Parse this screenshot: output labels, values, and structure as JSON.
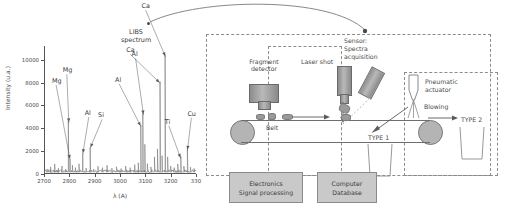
{
  "figure": {
    "callout": {
      "line1": "LIBS",
      "line2": "spectrum"
    }
  },
  "chart_data": {
    "type": "line",
    "title": "LIBS spectrum",
    "xlabel": "λ (A)",
    "ylabel": "Intensity (u.a.)",
    "xlim": [
      2700,
      3300
    ],
    "ylim": [
      0,
      11200
    ],
    "xticks": [
      "2700",
      "2800",
      "2900",
      "3000",
      "3100",
      "3200",
      "330"
    ],
    "xtick_values": [
      2700,
      2800,
      2900,
      3000,
      3100,
      3200,
      3300
    ],
    "yticks": [
      "0",
      "2000",
      "4000",
      "6000",
      "8000",
      "10000"
    ],
    "ytick_values": [
      0,
      2000,
      4000,
      6000,
      8000,
      10000
    ],
    "grid": false,
    "legend": false,
    "annotations": [
      {
        "label": "Mg",
        "x": 2798,
        "y": 4700
      },
      {
        "label": "Mg",
        "x": 2803,
        "y": 1500
      },
      {
        "label": "Al",
        "x": 2853,
        "y": 2000
      },
      {
        "label": "Si",
        "x": 2882,
        "y": 2500
      },
      {
        "label": "Al",
        "x": 3083,
        "y": 4400
      },
      {
        "label": "Al",
        "x": 3093,
        "y": 5400
      },
      {
        "label": "Ca",
        "x": 3159,
        "y": 8200
      },
      {
        "label": "Ca",
        "x": 3180,
        "y": 10500
      },
      {
        "label": "Ti",
        "x": 3240,
        "y": 1600
      },
      {
        "label": "Cu",
        "x": 3266,
        "y": 2300
      }
    ],
    "peaks": [
      {
        "x": 2712,
        "y": 430
      },
      {
        "x": 2726,
        "y": 620
      },
      {
        "x": 2742,
        "y": 880
      },
      {
        "x": 2757,
        "y": 500
      },
      {
        "x": 2771,
        "y": 700
      },
      {
        "x": 2786,
        "y": 420
      },
      {
        "x": 2796,
        "y": 4650
      },
      {
        "x": 2803,
        "y": 1280
      },
      {
        "x": 2812,
        "y": 780
      },
      {
        "x": 2824,
        "y": 560
      },
      {
        "x": 2838,
        "y": 900
      },
      {
        "x": 2853,
        "y": 1820
      },
      {
        "x": 2866,
        "y": 520
      },
      {
        "x": 2882,
        "y": 2320
      },
      {
        "x": 2896,
        "y": 430
      },
      {
        "x": 2913,
        "y": 680
      },
      {
        "x": 2931,
        "y": 560
      },
      {
        "x": 2949,
        "y": 760
      },
      {
        "x": 2968,
        "y": 520
      },
      {
        "x": 2986,
        "y": 640
      },
      {
        "x": 3004,
        "y": 480
      },
      {
        "x": 3022,
        "y": 700
      },
      {
        "x": 3040,
        "y": 560
      },
      {
        "x": 3058,
        "y": 820
      },
      {
        "x": 3072,
        "y": 980
      },
      {
        "x": 3082,
        "y": 4300
      },
      {
        "x": 3090,
        "y": 5350
      },
      {
        "x": 3098,
        "y": 2600
      },
      {
        "x": 3108,
        "y": 900
      },
      {
        "x": 3122,
        "y": 620
      },
      {
        "x": 3136,
        "y": 1500
      },
      {
        "x": 3148,
        "y": 2200
      },
      {
        "x": 3158,
        "y": 8100
      },
      {
        "x": 3166,
        "y": 1600
      },
      {
        "x": 3178,
        "y": 10450
      },
      {
        "x": 3188,
        "y": 1500
      },
      {
        "x": 3200,
        "y": 700
      },
      {
        "x": 3214,
        "y": 560
      },
      {
        "x": 3228,
        "y": 880
      },
      {
        "x": 3240,
        "y": 1550
      },
      {
        "x": 3252,
        "y": 700
      },
      {
        "x": 3266,
        "y": 2250
      },
      {
        "x": 3278,
        "y": 600
      },
      {
        "x": 3292,
        "y": 480
      }
    ]
  },
  "diagram": {
    "labels": {
      "fragment_detector": "Fragment\ndetector",
      "laser_shot": "Laser shot",
      "sensor": "Sensor:\nSpectra\nacquisition",
      "pneumatic_actuator": "Pneumatic\nactuator",
      "blowing": "Blowing",
      "belt": "Belt",
      "type1": "TYPE 1",
      "type2": "TYPE 2"
    },
    "boxes": [
      {
        "id": "electronics",
        "line1": "Electronics",
        "line2": "Signal processing"
      },
      {
        "id": "computer",
        "line1": "Computer",
        "line2": "Database"
      }
    ]
  },
  "colors": {
    "ink": "#3a3a3a",
    "dash": "#8c8c8c",
    "box_fill": "#c9c9c9",
    "box_border": "#8a8a8a",
    "roller": "#b4b4b4",
    "device": "#8d8d8d"
  }
}
